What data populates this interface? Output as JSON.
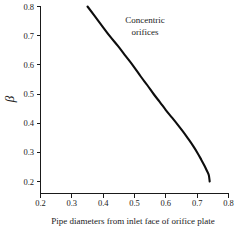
{
  "chart_data": {
    "type": "line",
    "title": "",
    "xlabel": "Pipe diameters from inlet face of orifice plate",
    "ylabel": "β",
    "xlim": [
      0.2,
      0.8
    ],
    "ylim": [
      0.2,
      0.8
    ],
    "xticks": [
      "0.2",
      "0.3",
      "0.4",
      "0.5",
      "0.6",
      "0.7",
      "0.8"
    ],
    "yticks": [
      "0.2",
      "0.3",
      "0.4",
      "0.5",
      "0.6",
      "0.7",
      "0.8"
    ],
    "xtick_values": [
      0.2,
      0.3,
      0.4,
      0.5,
      0.6,
      0.7,
      0.8
    ],
    "ytick_values": [
      0.2,
      0.3,
      0.4,
      0.5,
      0.6,
      0.7,
      0.8
    ],
    "grid": false,
    "legend": null,
    "series": [
      {
        "name": "Concentric orifices",
        "color": "#0d0d0d",
        "x": [
          0.35,
          0.385,
          0.42,
          0.447,
          0.472,
          0.497,
          0.52,
          0.541,
          0.561,
          0.581,
          0.6,
          0.619,
          0.637,
          0.655,
          0.671,
          0.687,
          0.701,
          0.713,
          0.723,
          0.731,
          0.737,
          0.74
        ],
        "y": [
          0.8,
          0.75,
          0.7,
          0.665,
          0.63,
          0.595,
          0.56,
          0.53,
          0.5,
          0.472,
          0.445,
          0.42,
          0.396,
          0.371,
          0.347,
          0.322,
          0.298,
          0.275,
          0.255,
          0.237,
          0.222,
          0.2
        ]
      }
    ],
    "annotations": [
      {
        "name": "concentric-orifices-label",
        "line1": "Concentric",
        "line2": "orifices",
        "x": 0.535,
        "y": 0.755
      }
    ]
  },
  "figure": {
    "background": "#ffffff",
    "axis_color": "#1a1a1a"
  }
}
